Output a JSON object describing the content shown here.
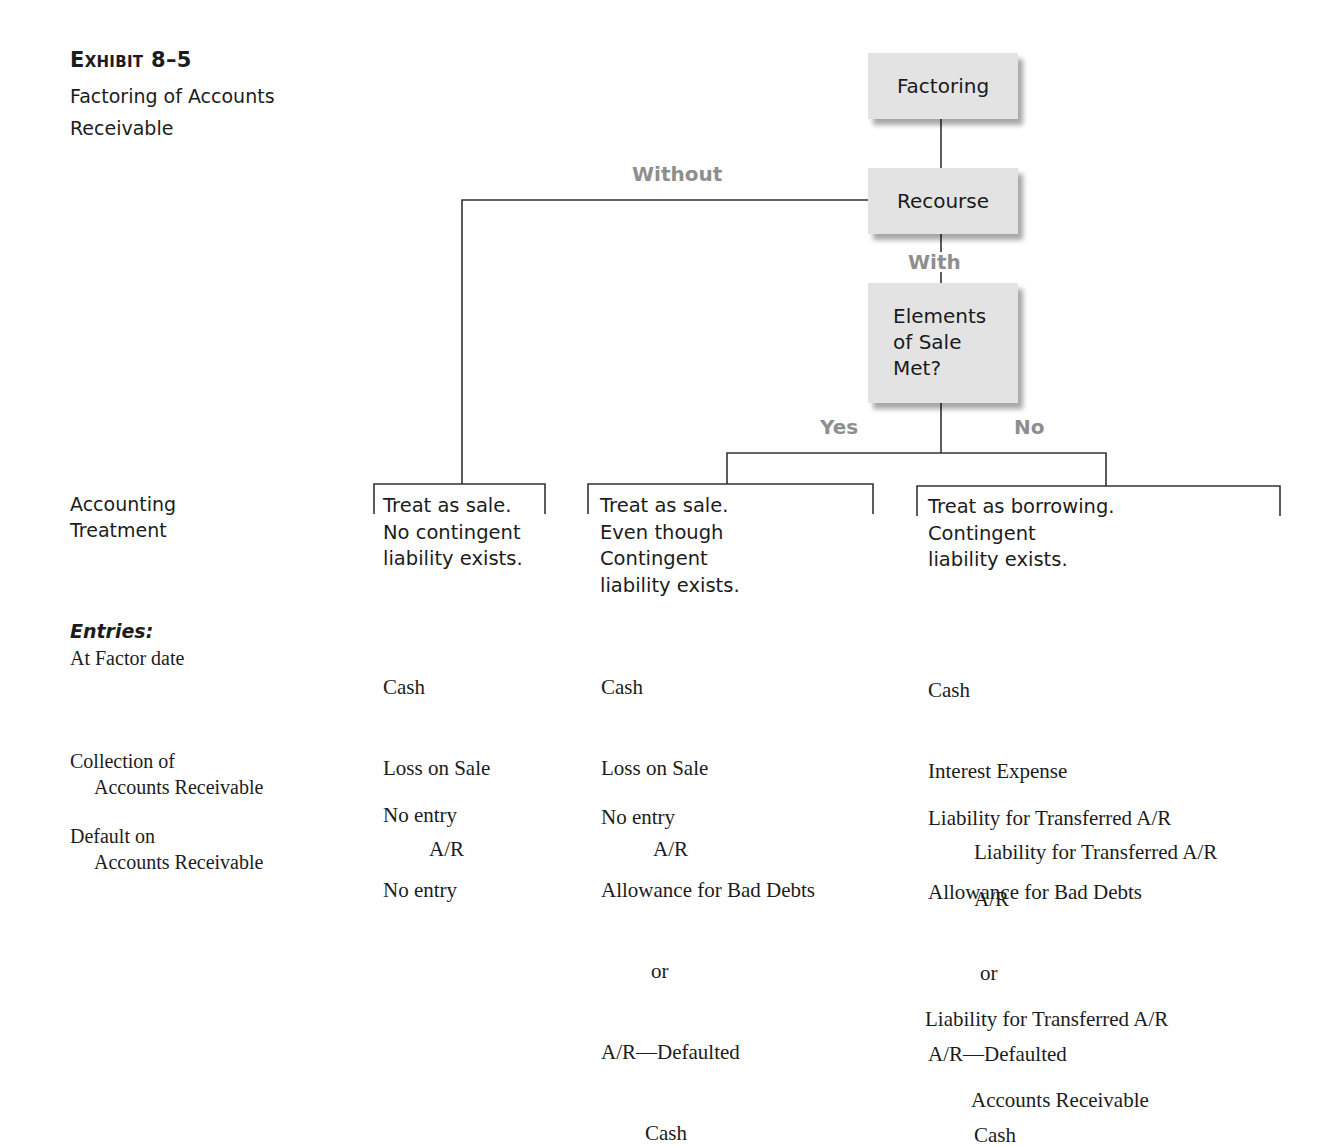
{
  "exhibit": {
    "label": "Exhibit 8–5",
    "subtitle_line1": "Factoring of Accounts",
    "subtitle_line2": "Receivable"
  },
  "flowchart": {
    "nodes": {
      "factoring": "Factoring",
      "recourse": "Recourse",
      "elements_line1": "Elements",
      "elements_line2": "of Sale",
      "elements_line3": "Met?"
    },
    "branch_labels": {
      "without": "Without",
      "with": "With",
      "yes": "Yes",
      "no": "No"
    },
    "colors": {
      "node_fill": "#e3e3e3",
      "branch_label": "#8e8e8e",
      "line": "#333333"
    }
  },
  "row_labels": {
    "accounting_treatment_line1": "Accounting",
    "accounting_treatment_line2": "Treatment",
    "entries_heading": "Entries:",
    "at_factor_date": "At Factor date",
    "collection_line1": "Collection of",
    "collection_line2": "Accounts Receivable",
    "default_line1": "Default on",
    "default_line2": "Accounts Receivable"
  },
  "columns": [
    {
      "treatment": [
        "Treat as sale.",
        "No contingent",
        "liability exists."
      ],
      "at_factor_date": [
        "Cash",
        "Loss on Sale",
        "A/R"
      ],
      "collection": [
        "No entry"
      ],
      "default": [
        "No entry"
      ],
      "default_extra": []
    },
    {
      "treatment": [
        "Treat as sale.",
        "Even though",
        "Contingent",
        "liability exists."
      ],
      "at_factor_date": [
        "Cash",
        "Loss on Sale",
        "A/R"
      ],
      "collection": [
        "No entry"
      ],
      "default": [
        "Allowance for Bad Debts",
        "or",
        "A/R—Defaulted",
        "Cash"
      ],
      "default_extra": []
    },
    {
      "treatment": [
        "Treat as borrowing.",
        "Contingent",
        "liability exists."
      ],
      "at_factor_date": [
        "Cash",
        "Interest Expense",
        "Liability for Transferred A/R"
      ],
      "collection": [
        "Liability for Transferred A/R",
        "A/R"
      ],
      "default": [
        "Allowance for Bad Debts",
        "or",
        "A/R—Defaulted",
        "Cash"
      ],
      "default_extra": [
        "Liability for Transferred A/R",
        "Accounts Receivable"
      ]
    }
  ]
}
